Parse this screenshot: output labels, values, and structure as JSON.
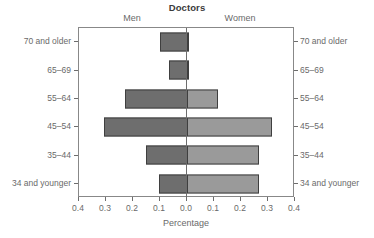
{
  "chart_data": {
    "type": "bar",
    "subtype": "population-pyramid",
    "title": "Doctors",
    "xlabel": "Percentage",
    "ylabel": "",
    "categories": [
      "70 and older",
      "65–69",
      "55–64",
      "45–54",
      "35–44",
      "34 and younger"
    ],
    "series": [
      {
        "name": "Men",
        "side": "left",
        "color": "#6e6e6e",
        "values": [
          0.1,
          0.067,
          0.23,
          0.307,
          0.152,
          0.104
        ]
      },
      {
        "name": "Women",
        "side": "right",
        "color": "#9a9a9a",
        "values": [
          0.005,
          0.005,
          0.115,
          0.315,
          0.265,
          0.265
        ]
      }
    ],
    "xlim": [
      -0.4,
      0.4
    ],
    "xticks": [
      -0.4,
      -0.3,
      -0.2,
      -0.1,
      0.0,
      0.1,
      0.2,
      0.3,
      0.4
    ],
    "xtick_labels": [
      "0.4",
      "0.3",
      "0.2",
      "0.1",
      "0.0",
      "0.1",
      "0.2",
      "0.3",
      "0.4"
    ],
    "grid": false,
    "legend": "none",
    "group_labels": {
      "left": "Men",
      "right": "Women"
    },
    "y_axis_labels_both_sides": true,
    "bar_edge_color": "#3f3f3f",
    "axis_color": "#6d6d6d"
  },
  "axis_labels_left": [
    "70 and older",
    "65–69",
    "55–64",
    "45–54",
    "35–44",
    "34 and younger"
  ],
  "axis_labels_right": [
    "70 and older",
    "65–69",
    "55–64",
    "45–54",
    "35–44",
    "34 and younger"
  ]
}
